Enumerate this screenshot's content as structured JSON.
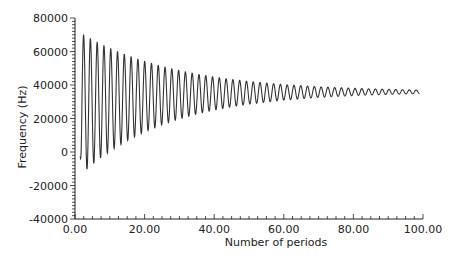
{
  "chart_data": {
    "type": "line",
    "title": "",
    "xlabel": "Number of periods",
    "ylabel": "Frequency (Hz)",
    "xlim": [
      0,
      100
    ],
    "ylim": [
      -40000,
      80000
    ],
    "x_ticks": [
      0,
      20,
      40,
      60,
      80,
      100
    ],
    "x_tick_labels": [
      "0.00",
      "20.00",
      "40.00",
      "60.00",
      "80.00",
      "100.00"
    ],
    "y_ticks": [
      -40000,
      -20000,
      0,
      20000,
      40000,
      60000,
      80000
    ],
    "y_tick_labels": [
      "-40000",
      "-20000",
      "0",
      "20000",
      "40000",
      "60000",
      "80000"
    ],
    "grid": false,
    "legend": null,
    "series": [
      {
        "name": "Frequency",
        "color": "#333333",
        "description": "Damped oscillation starting near 0 Hz at ~1.5 periods, initial peaks ~73000 Hz and troughs ~-18000 Hz, decaying toward ~36000 Hz by 99 periods; oscillation period ~1.95 units",
        "x_start": 1.5,
        "x_end": 99,
        "oscillation_period": 1.95,
        "envelope": {
          "x": [
            2,
            3,
            4,
            5,
            6,
            7,
            8,
            9,
            10,
            12,
            14,
            16,
            18,
            20,
            25,
            30,
            35,
            40,
            45,
            50,
            60,
            70,
            80,
            90,
            99
          ],
          "center": [
            28760,
            29110,
            29450,
            29770,
            30070,
            30360,
            30640,
            30900,
            31150,
            31610,
            32030,
            32400,
            32750,
            33060,
            33700,
            34220,
            34610,
            34920,
            35160,
            35340,
            35600,
            35760,
            35850,
            35910,
            35940
          ],
          "amplitude": [
            41700,
            40150,
            38670,
            37220,
            35830,
            34490,
            33200,
            31960,
            30770,
            28520,
            26430,
            24490,
            22710,
            21040,
            17400,
            14390,
            11900,
            9840,
            8140,
            6730,
            4600,
            3150,
            2150,
            1470,
            1050
          ]
        },
        "start_value": 0,
        "approx_first_peak": 73000,
        "approx_min_trough": -18000,
        "final_value": 35500
      }
    ]
  }
}
